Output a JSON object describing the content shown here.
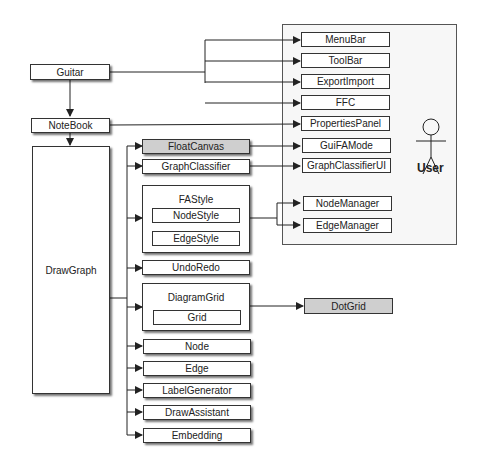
{
  "nodes": {
    "guitar": "Guitar",
    "notebook": "NoteBook",
    "drawgraph": "DrawGraph",
    "floatcanvas": "FloatCanvas",
    "graphclassifier": "GraphClassifier",
    "fastyle": "FAStyle",
    "nodestyle": "NodeStyle",
    "edgestyle": "EdgeStyle",
    "undoredo": "UndoRedo",
    "diagramgrid": "DiagramGrid",
    "grid": "Grid",
    "node": "Node",
    "edge": "Edge",
    "labelgenerator": "LabelGenerator",
    "drawassistant": "DrawAssistant",
    "embedding": "Embedding",
    "dotgrid": "DotGrid"
  },
  "user_panel": {
    "actor_label": "User",
    "items": [
      "MenuBar",
      "ToolBar",
      "ExportImport",
      "FFC",
      "PropertiesPanel",
      "GuiFAMode",
      "GraphClassifierUI",
      "NodeManager",
      "EdgeManager"
    ]
  },
  "colors": {
    "highlight": "#cfcfcf",
    "border": "#333333"
  }
}
